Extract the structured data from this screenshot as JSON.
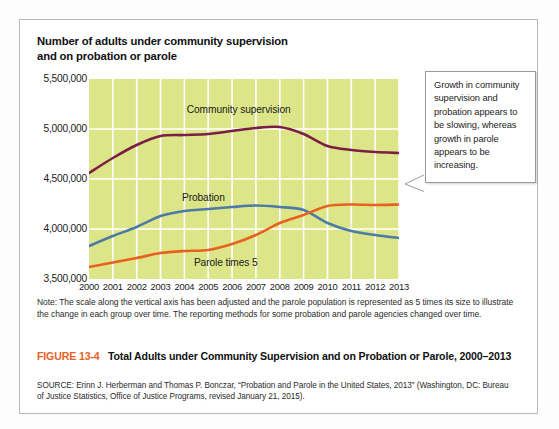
{
  "figure": {
    "chart_title_line1": "Number of adults under community supervision",
    "chart_title_line2": "and on probation or parole",
    "callout_text": "Growth in community supervision and probation appears to be slowing, whereas growth in parole appears to be increasing.",
    "note_text": "Note: The scale along the vertical axis has been adjusted and the parole population is represented as 5 times its size to illustrate the change in each group over time. The reporting methods for some probation and parole agencies changed over time.",
    "figure_number": "FIGURE 13-4",
    "caption_text": "Total Adults under Community Supervision and on Probation or Parole, 2000–2013",
    "source_text": "SOURCE: Erinn J. Herberman and Thomas P. Bonczar, “Probation and Parole in the United States, 2013” (Washington, DC: Bureau of Justice Statistics, Office of Justice Programs, revised January 21, 2015)."
  },
  "colors": {
    "plot_background": "#dde589",
    "gridline": "#ffffff",
    "community_supervision": "#7a1e46",
    "probation": "#4d7ba8",
    "parole_times_5": "#e8621f",
    "accent_orange": "#e8621f",
    "frame_border": "#b9b9b9",
    "callout_border": "#9a9a9a",
    "page_background": "#ffffff"
  },
  "chart_data": {
    "type": "line",
    "title": "Number of adults under community supervision and on probation or parole",
    "xlabel": "",
    "ylabel": "",
    "x": [
      2000,
      2001,
      2002,
      2003,
      2004,
      2005,
      2006,
      2007,
      2008,
      2009,
      2010,
      2011,
      2012,
      2013
    ],
    "categories": [
      "2000",
      "2001",
      "2002",
      "2003",
      "2004",
      "2005",
      "2006",
      "2007",
      "2008",
      "2009",
      "2010",
      "2011",
      "2012",
      "2013"
    ],
    "ylim": [
      3500000,
      5500000
    ],
    "ytick_values": [
      3500000,
      4000000,
      4500000,
      5000000,
      5500000
    ],
    "ytick_labels": [
      "3,500,000",
      "4,000,000",
      "4,500,000",
      "5,000,000",
      "5,500,000"
    ],
    "grid": true,
    "legend": "inline-labels",
    "series": [
      {
        "name": "Community supervision",
        "color": "#7a1e46",
        "label_x": 2004.1,
        "label_y": 5180000,
        "values": [
          4560000,
          4710000,
          4840000,
          4930000,
          4940000,
          4950000,
          4980000,
          5010000,
          5020000,
          4950000,
          4830000,
          4790000,
          4770000,
          4760000
        ]
      },
      {
        "name": "Probation",
        "color": "#4d7ba8",
        "label_x": 2003.9,
        "label_y": 4300000,
        "values": [
          3830000,
          3930000,
          4020000,
          4130000,
          4180000,
          4200000,
          4220000,
          4235000,
          4220000,
          4190000,
          4060000,
          3980000,
          3940000,
          3910000
        ]
      },
      {
        "name": "Parole times 5",
        "color": "#e8621f",
        "label_x": 2004.4,
        "label_y": 3650000,
        "values": [
          3620000,
          3665000,
          3710000,
          3760000,
          3780000,
          3790000,
          3850000,
          3940000,
          4060000,
          4140000,
          4230000,
          4245000,
          4240000,
          4245000
        ]
      }
    ]
  }
}
